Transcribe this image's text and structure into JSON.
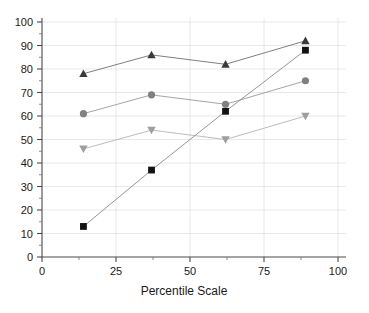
{
  "chart_data": {
    "type": "line",
    "title": "",
    "subtitle": "",
    "xlabel": "Percentile Scale",
    "ylabel": "",
    "xlim": [
      0,
      100
    ],
    "ylim": [
      0,
      100
    ],
    "x_ticks": [
      0,
      25,
      50,
      75,
      100
    ],
    "x_tick_labels": [
      "0",
      "25",
      "50",
      "75",
      "100"
    ],
    "x_minor_ticks": [
      12.5,
      37.5,
      62.5,
      87.5
    ],
    "y_ticks": [
      0,
      10,
      20,
      30,
      40,
      50,
      60,
      70,
      80,
      90,
      100
    ],
    "y_tick_labels": [
      "0",
      "10",
      "20",
      "30",
      "40",
      "50",
      "60",
      "70",
      "80",
      "90",
      "100"
    ],
    "y_minor_ticks": [
      5,
      15,
      25,
      35,
      45,
      55,
      65,
      75,
      85,
      95
    ],
    "grid": true,
    "grid_axis": "both",
    "legend": false,
    "legend_position": "none",
    "x": [
      14,
      37,
      62,
      89
    ],
    "series": [
      {
        "name": "triangle-up-series",
        "marker": "triangle-up",
        "color": "#3a3a3a",
        "line_color": "#707070",
        "values": [
          78,
          86,
          82,
          92
        ]
      },
      {
        "name": "circle-series",
        "marker": "circle",
        "color": "#808080",
        "line_color": "#9a9a9a",
        "values": [
          61,
          69,
          65,
          75
        ]
      },
      {
        "name": "triangle-down-series",
        "marker": "triangle-down",
        "color": "#9e9e9e",
        "line_color": "#b4b4b4",
        "values": [
          46,
          54,
          50,
          60
        ]
      },
      {
        "name": "square-series",
        "marker": "square",
        "color": "#111111",
        "line_color": "#8a8a8a",
        "values": [
          13,
          37,
          62,
          88
        ]
      }
    ]
  },
  "axes": {
    "x_axis_title": "Percentile Scale"
  },
  "colors": {
    "background": "#ffffff",
    "grid": "#e2e2e2",
    "axis": "#4a4a4a",
    "text": "#1a1a1a"
  }
}
